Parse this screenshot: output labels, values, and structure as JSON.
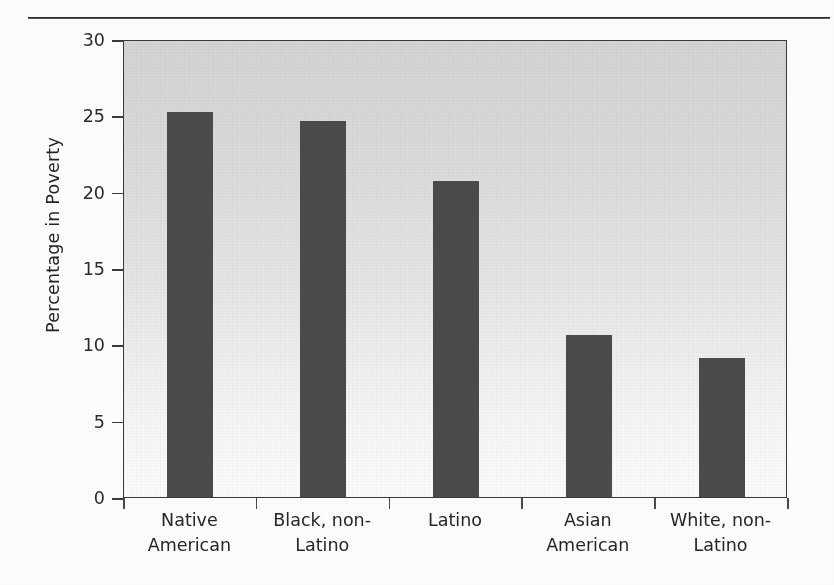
{
  "figure": {
    "background_color": "#fdfdfd",
    "plot_background_top": "#d6d6d6",
    "plot_background_bottom": "#fdfdfd",
    "bar_color": "#4b4b4b",
    "axis_color": "#3a3a3a"
  },
  "chart_data": {
    "type": "bar",
    "title": "",
    "subtitle": "",
    "xlabel": "",
    "ylabel": "Percentage in Poverty",
    "categories": [
      "Native American",
      "Black, non-Latino",
      "Latino",
      "Asian American",
      "White, non-Latino"
    ],
    "category_lines": [
      [
        "Native",
        "American"
      ],
      [
        "Black, non-",
        "Latino"
      ],
      [
        "Latino",
        ""
      ],
      [
        "Asian",
        "American"
      ],
      [
        "White, non-",
        "Latino"
      ]
    ],
    "values": [
      25.2,
      24.6,
      20.7,
      10.6,
      9.1
    ],
    "ylim": [
      0,
      30
    ],
    "yticks": [
      0,
      5,
      10,
      15,
      20,
      25,
      30
    ],
    "ytick_labels": [
      "0",
      "5",
      "10",
      "15",
      "20",
      "25",
      "30"
    ],
    "grid": false,
    "legend": null,
    "annotations": []
  }
}
